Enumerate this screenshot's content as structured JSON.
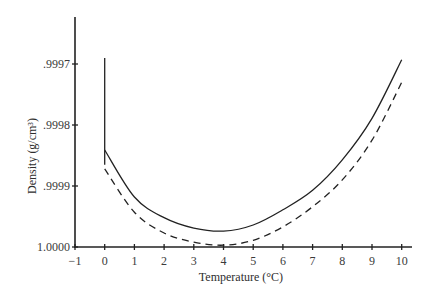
{
  "chart_data": {
    "type": "line",
    "title": "",
    "xlabel": "Temperature (°C)",
    "ylabel": "Density (g/cm³)",
    "xlim": [
      -1,
      10.35
    ],
    "ylim": [
      1.0,
      0.99965
    ],
    "y_inverted": true,
    "grid": false,
    "legend": null,
    "x_ticks": [
      -1,
      0,
      1,
      2,
      3,
      4,
      5,
      6,
      7,
      8,
      9,
      10
    ],
    "x_tick_labels": [
      "−1",
      "0",
      "1",
      "2",
      "3",
      "4",
      "5",
      "6",
      "7",
      "8",
      "9",
      "10"
    ],
    "y_ticks": [
      0.9997,
      0.9998,
      0.9999,
      1.0
    ],
    "y_tick_labels": [
      ".9997",
      ".9998",
      ".9999",
      "1.0000"
    ],
    "x": [
      0,
      1,
      2,
      3,
      4,
      5,
      6,
      7,
      8,
      9,
      10
    ],
    "series": [
      {
        "name": "solid",
        "style": "solid",
        "values": [
          0.999841,
          0.999918,
          0.999952,
          0.999969,
          0.999974,
          0.999964,
          0.999939,
          0.999907,
          0.999857,
          0.999789,
          0.999693
        ]
      },
      {
        "name": "dashed",
        "style": "dashed",
        "values": [
          0.999872,
          0.999943,
          0.999977,
          0.999992,
          0.999997,
          0.999989,
          0.999967,
          0.999934,
          0.99989,
          0.999825,
          0.99973
        ]
      }
    ],
    "annotations": [
      {
        "type": "vertical-line",
        "x": 0,
        "y_from": 0.99969,
        "y_to": 0.999865,
        "style": "solid"
      }
    ]
  }
}
